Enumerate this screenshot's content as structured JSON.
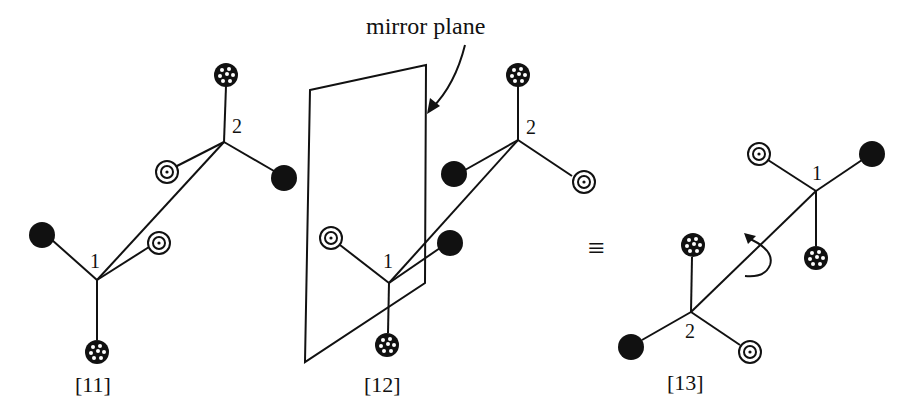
{
  "figure": {
    "mirror_plane_label": "mirror plane",
    "equivalence_symbol": "≡",
    "structures": [
      {
        "id": "[11]",
        "center_labels": [
          "1",
          "2"
        ]
      },
      {
        "id": "[12]",
        "center_labels": [
          "1",
          "2"
        ]
      },
      {
        "id": "[13]",
        "center_labels": [
          "1",
          "2"
        ]
      }
    ],
    "substituent_types": [
      "filled-black-ball",
      "double-circle-ball",
      "dotted-ball"
    ],
    "colors": {
      "ink": "#111111",
      "background": "#ffffff"
    }
  }
}
